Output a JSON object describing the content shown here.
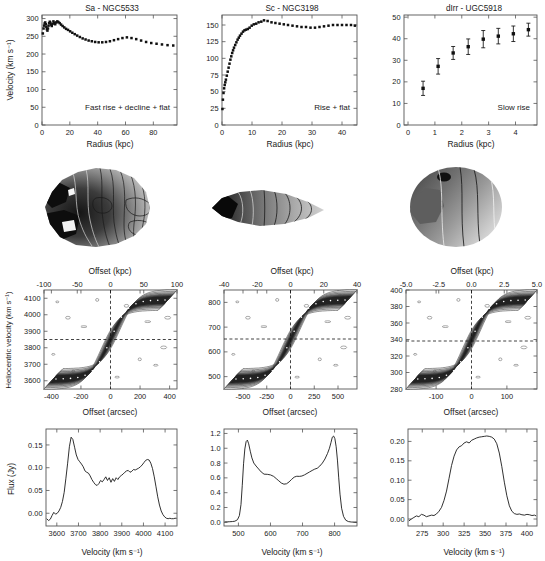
{
  "figure": {
    "n_columns": 3,
    "n_rows": 4,
    "row_kinds": [
      "rotation-curve",
      "velocity-field-map",
      "position-velocity-diagram",
      "global-hi-profile"
    ]
  },
  "columns": [
    {
      "id": "col1",
      "title": "Sa - NGC5533",
      "type_label": "Sa",
      "galaxy": "NGC5533",
      "annotation": "Fast rise + decline + flat"
    },
    {
      "id": "col2",
      "title": "Sc - NGC3198",
      "type_label": "Sc",
      "galaxy": "NGC3198",
      "annotation": "Rise + flat"
    },
    {
      "id": "col3",
      "title": "dIrr - UGC5918",
      "type_label": "dIrr",
      "galaxy": "UGC5918",
      "annotation": "Slow rise"
    }
  ],
  "axis_labels": {
    "velocity_y": "Velocity (km s⁻¹)",
    "radius_x": "Radius (kpc)",
    "offset_kpc": "Offset (kpc)",
    "offset_arcsec": "Offset (arcsec)",
    "heliocentric_y": "Heliocentric velocity (km s⁻¹)",
    "flux_y": "Flux (Jy)",
    "velocity_x": "Velocity (km s⁻¹)"
  },
  "chart_data": [
    {
      "id": "rotcurve-ngc5533",
      "type": "scatter",
      "title": "Sa - NGC5533",
      "xlabel": "Radius (kpc)",
      "ylabel": "Velocity (km s⁻¹)",
      "xlim": [
        0,
        97
      ],
      "ylim": [
        0,
        310
      ],
      "xticks": [
        0,
        20,
        40,
        60,
        80
      ],
      "yticks": [
        0,
        50,
        100,
        150,
        200,
        250,
        300
      ],
      "annotation": "Fast rise + decline + flat",
      "x": [
        0.6,
        1.1,
        1.5,
        1.9,
        2.3,
        2.7,
        3.1,
        3.5,
        3.9,
        4.3,
        4.7,
        5.1,
        5.6,
        6.0,
        6.5,
        7.0,
        7.6,
        8.2,
        8.8,
        9.5,
        10.2,
        11.0,
        11.8,
        12.7,
        13.7,
        14.8,
        16.0,
        17.3,
        18.7,
        20.2,
        21.8,
        23.5,
        25.3,
        27.2,
        29.2,
        31.3,
        33.5,
        35.8,
        38.2,
        40.7,
        43.3,
        46.0,
        48.8,
        51.7,
        54.7,
        57.8,
        61.0,
        64.3,
        67.7,
        71.2,
        74.8,
        78.5,
        82.3,
        86.2,
        90.2,
        94.3
      ],
      "y": [
        258,
        272,
        280,
        286,
        289,
        284,
        277,
        270,
        266,
        272,
        280,
        287,
        291,
        288,
        283,
        279,
        285,
        292,
        288,
        284,
        289,
        292,
        290,
        287,
        283,
        279,
        275,
        271,
        268,
        264,
        260,
        256,
        252,
        248,
        244,
        241,
        238,
        236,
        234,
        233,
        233,
        234,
        236,
        239,
        242,
        245,
        247,
        245,
        242,
        238,
        234,
        231,
        229,
        227,
        225,
        224
      ]
    },
    {
      "id": "rotcurve-ngc3198",
      "type": "scatter",
      "title": "Sc - NGC3198",
      "xlabel": "Radius (kpc)",
      "ylabel": "Velocity (km s⁻¹)",
      "xlim": [
        0,
        45
      ],
      "ylim": [
        0,
        165
      ],
      "xticks": [
        0,
        10,
        20,
        30,
        40
      ],
      "yticks": [
        0,
        25,
        50,
        75,
        100,
        125,
        150
      ],
      "annotation": "Rise + flat",
      "x": [
        0.15,
        0.3,
        0.5,
        0.7,
        0.9,
        1.1,
        1.3,
        1.6,
        1.9,
        2.2,
        2.5,
        2.8,
        3.1,
        3.4,
        3.7,
        4.0,
        4.4,
        4.8,
        5.2,
        5.6,
        6.0,
        6.5,
        7.0,
        7.5,
        8.0,
        8.6,
        9.2,
        9.9,
        10.6,
        11.4,
        12.2,
        13.1,
        14.0,
        15.2,
        16.5,
        17.8,
        19.2,
        20.6,
        22.0,
        23.5,
        25.0,
        26.5,
        28.0,
        29.5,
        31.0,
        32.5,
        34.0,
        35.5,
        37.0,
        38.5,
        40.0,
        41.5,
        43.0,
        44.3
      ],
      "y": [
        24,
        38,
        48,
        55,
        60,
        64,
        68,
        74,
        80,
        86,
        92,
        98,
        103,
        108,
        112,
        116,
        120,
        124,
        128,
        131,
        134,
        137,
        140,
        142,
        143,
        144,
        146,
        149,
        151,
        152,
        154,
        155,
        157,
        156,
        154,
        153,
        152,
        151,
        150,
        149,
        148,
        147,
        147,
        146,
        146,
        147,
        148,
        149,
        150,
        150,
        150,
        150,
        150,
        149
      ]
    },
    {
      "id": "rotcurve-ugc5918",
      "type": "scatter-errorbar",
      "title": "dIrr - UGC5918",
      "xlabel": "Radius (kpc)",
      "ylabel": "Velocity (km s⁻¹)",
      "xlim": [
        -0.15,
        4.8
      ],
      "ylim": [
        0,
        51
      ],
      "xticks": [
        0,
        1,
        2,
        3,
        4
      ],
      "yticks": [
        0,
        10,
        20,
        30,
        40,
        50
      ],
      "annotation": "Slow rise",
      "x": [
        0.56,
        1.12,
        1.68,
        2.24,
        2.8,
        3.36,
        3.92,
        4.48
      ],
      "y": [
        17.0,
        27.2,
        33.4,
        36.3,
        39.8,
        41.2,
        42.3,
        44.2
      ],
      "yerr": [
        3.3,
        3.6,
        3.0,
        3.6,
        4.0,
        3.6,
        3.6,
        3.0
      ]
    },
    {
      "id": "pvd-ngc5533",
      "type": "contour",
      "xlabel": "Offset (arcsec)",
      "xlabel_top": "Offset (kpc)",
      "ylabel": "Heliocentric velocity (km s⁻¹)",
      "xlim": [
        -450,
        450
      ],
      "ylim": [
        3550,
        4150
      ],
      "xticks": [
        -400,
        -200,
        0,
        200,
        400
      ],
      "xticks_top": [
        -100,
        -50,
        0,
        50,
        100
      ],
      "yticks": [
        3600,
        3700,
        3800,
        3900,
        4000,
        4100
      ],
      "systemic_velocity": 3855,
      "center_offset": 0
    },
    {
      "id": "pvd-ngc3198",
      "type": "contour",
      "xlabel": "Offset (arcsec)",
      "xlabel_top": "Offset (kpc)",
      "ylabel": "Heliocentric velocity (km s⁻¹)",
      "xlim": [
        -700,
        700
      ],
      "ylim": [
        450,
        850
      ],
      "xticks": [
        -500,
        -250,
        0,
        250,
        500
      ],
      "xticks_top": [
        -40,
        -20,
        0,
        20,
        40
      ],
      "yticks": [
        500,
        600,
        700,
        800
      ],
      "systemic_velocity": 655,
      "center_offset": 0
    },
    {
      "id": "pvd-ugc5918",
      "type": "contour",
      "xlabel": "Offset (arcsec)",
      "xlabel_top": "Offset (kpc)",
      "ylabel": "Heliocentric velocity (km s⁻¹)",
      "xlim": [
        -185,
        185
      ],
      "ylim": [
        280,
        400
      ],
      "xticks": [
        -100,
        0,
        100
      ],
      "xticks_top": [
        -5.0,
        -2.5,
        0.0,
        2.5,
        5.0
      ],
      "yticks": [
        280,
        300,
        320,
        340,
        360,
        380,
        400
      ],
      "systemic_velocity": 338,
      "center_offset": 0
    },
    {
      "id": "profile-ngc5533",
      "type": "line",
      "xlabel": "Velocity (km s⁻¹)",
      "ylabel": "Flux (Jy)",
      "xlim": [
        3550,
        4155
      ],
      "ylim": [
        -0.028,
        0.185
      ],
      "xticks": [
        3600,
        3700,
        3800,
        3900,
        4000,
        4100
      ],
      "yticks": [
        0.0,
        0.05,
        0.1,
        0.15
      ],
      "ytick_labels": [
        "0.00",
        "0.05",
        "0.10",
        "0.15"
      ],
      "x": [
        3553,
        3562,
        3570,
        3578,
        3586,
        3594,
        3602,
        3610,
        3618,
        3626,
        3634,
        3642,
        3650,
        3658,
        3666,
        3674,
        3682,
        3690,
        3698,
        3706,
        3714,
        3722,
        3730,
        3738,
        3746,
        3754,
        3762,
        3770,
        3778,
        3786,
        3794,
        3802,
        3810,
        3818,
        3826,
        3834,
        3842,
        3850,
        3858,
        3866,
        3874,
        3882,
        3890,
        3898,
        3906,
        3914,
        3922,
        3930,
        3938,
        3946,
        3954,
        3962,
        3970,
        3978,
        3986,
        3994,
        4002,
        4010,
        4018,
        4026,
        4034,
        4042,
        4050,
        4058,
        4066,
        4074,
        4082,
        4090,
        4098,
        4106,
        4114,
        4122,
        4130,
        4138,
        4146,
        4153
      ],
      "y": [
        -0.012,
        -0.016,
        -0.013,
        -0.005,
        0.002,
        -0.002,
        0.0,
        0.005,
        0.013,
        0.026,
        0.046,
        0.077,
        0.11,
        0.146,
        0.167,
        0.162,
        0.145,
        0.128,
        0.118,
        0.113,
        0.108,
        0.102,
        0.093,
        0.09,
        0.088,
        0.082,
        0.074,
        0.068,
        0.063,
        0.061,
        0.065,
        0.072,
        0.069,
        0.074,
        0.08,
        0.072,
        0.078,
        0.068,
        0.076,
        0.07,
        0.078,
        0.074,
        0.08,
        0.083,
        0.086,
        0.09,
        0.093,
        0.094,
        0.09,
        0.092,
        0.096,
        0.095,
        0.097,
        0.099,
        0.102,
        0.106,
        0.111,
        0.116,
        0.118,
        0.117,
        0.11,
        0.098,
        0.08,
        0.058,
        0.036,
        0.018,
        0.005,
        -0.003,
        -0.008,
        -0.011,
        -0.012,
        -0.011,
        -0.012,
        -0.012,
        -0.011,
        -0.011
      ]
    },
    {
      "id": "profile-ngc3198",
      "type": "line",
      "xlabel": "Velocity (km s⁻¹)",
      "ylabel": "Flux (Jy)",
      "xlim": [
        455,
        870
      ],
      "ylim": [
        -0.05,
        1.26
      ],
      "xticks": [
        500,
        600,
        700,
        800
      ],
      "yticks": [
        0.0,
        0.2,
        0.4,
        0.6,
        0.8,
        1.0,
        1.2
      ],
      "ytick_labels": [
        "0.0",
        "0.2",
        "0.4",
        "0.6",
        "0.8",
        "1.0",
        "1.2"
      ],
      "x": [
        457,
        465,
        473,
        481,
        489,
        497,
        503,
        508,
        512,
        516,
        520,
        524,
        528,
        532,
        537,
        542,
        548,
        555,
        563,
        571,
        580,
        590,
        600,
        610,
        618,
        626,
        634,
        642,
        650,
        658,
        666,
        674,
        682,
        690,
        698,
        706,
        714,
        722,
        730,
        738,
        746,
        754,
        762,
        770,
        778,
        784,
        789,
        793,
        797,
        801,
        805,
        809,
        813,
        817,
        822,
        828,
        835,
        843,
        852,
        862,
        869
      ],
      "y": [
        0.005,
        0.006,
        0.008,
        0.01,
        0.015,
        0.035,
        0.09,
        0.24,
        0.5,
        0.79,
        0.99,
        1.09,
        1.11,
        1.06,
        0.96,
        0.87,
        0.8,
        0.76,
        0.72,
        0.68,
        0.65,
        0.648,
        0.64,
        0.62,
        0.59,
        0.56,
        0.53,
        0.515,
        0.52,
        0.545,
        0.58,
        0.61,
        0.622,
        0.62,
        0.625,
        0.64,
        0.66,
        0.68,
        0.7,
        0.718,
        0.73,
        0.76,
        0.8,
        0.855,
        0.93,
        1.0,
        1.08,
        1.15,
        1.165,
        1.13,
        1.02,
        0.84,
        0.6,
        0.38,
        0.19,
        0.08,
        0.028,
        0.01,
        0.004,
        0.002,
        0.002
      ]
    },
    {
      "id": "profile-ugc5918",
      "type": "line",
      "xlabel": "Velocity (km s⁻¹)",
      "ylabel": "Flux (Jy)",
      "xlim": [
        258,
        412
      ],
      "ylim": [
        -0.018,
        0.232
      ],
      "xticks": [
        275,
        300,
        325,
        350,
        375,
        400
      ],
      "yticks": [
        0.0,
        0.05,
        0.1,
        0.15,
        0.2
      ],
      "ytick_labels": [
        "0.00",
        "0.05",
        "0.10",
        "0.15",
        "0.20"
      ],
      "x": [
        259,
        262,
        265,
        268,
        271,
        274,
        277,
        280,
        283,
        286,
        289,
        292,
        295,
        298,
        301,
        304,
        307,
        310,
        313,
        316,
        319,
        322,
        325,
        328,
        331,
        334,
        337,
        340,
        343,
        346,
        349,
        352,
        355,
        358,
        361,
        364,
        367,
        370,
        373,
        376,
        379,
        382,
        385,
        388,
        391,
        394,
        397,
        400,
        403,
        406,
        409,
        411
      ],
      "y": [
        -0.005,
        0.0,
        0.004,
        0.008,
        0.006,
        0.012,
        0.01,
        0.006,
        0.008,
        0.01,
        0.009,
        0.013,
        0.02,
        0.03,
        0.048,
        0.072,
        0.105,
        0.138,
        0.162,
        0.178,
        0.186,
        0.189,
        0.196,
        0.199,
        0.196,
        0.203,
        0.206,
        0.209,
        0.211,
        0.212,
        0.213,
        0.214,
        0.213,
        0.211,
        0.206,
        0.194,
        0.17,
        0.135,
        0.095,
        0.06,
        0.034,
        0.02,
        0.014,
        0.012,
        0.013,
        0.011,
        0.01,
        0.012,
        0.011,
        0.009,
        0.01,
        0.008
      ]
    }
  ],
  "velocity_fields": [
    {
      "id": "vfield-ngc5533",
      "galaxy": "NGC5533",
      "shape": "irregular-patchy",
      "description": "HI velocity field with iso-velocity contours"
    },
    {
      "id": "vfield-ngc3198",
      "galaxy": "NGC3198",
      "shape": "elongated-edge-on",
      "description": "HI velocity field with iso-velocity contours"
    },
    {
      "id": "vfield-ugc5918",
      "galaxy": "UGC5918",
      "shape": "round-compact",
      "description": "HI velocity field with iso-velocity contours"
    }
  ]
}
